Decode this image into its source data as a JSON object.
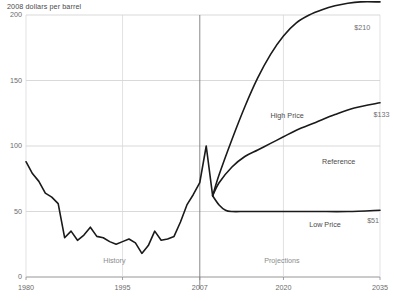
{
  "chart_data": {
    "type": "line",
    "title": "2008 dollars per barrel",
    "xlabel": "",
    "ylabel": "2008 dollars per barrel",
    "xlim": [
      1980,
      2035
    ],
    "ylim": [
      0,
      200
    ],
    "grid": true,
    "legend_position": "inline-annotations",
    "yticks": [
      "0",
      "50",
      "100",
      "150",
      "200"
    ],
    "ytick_values": [
      0,
      50,
      100,
      150,
      200
    ],
    "xticks": [
      "1980",
      "1995",
      "2007",
      "2020",
      "2035"
    ],
    "xtick_values": [
      1980,
      1995,
      2007,
      2020,
      2035
    ],
    "annotations": [
      {
        "text": "History",
        "x": 1992,
        "y": 12
      },
      {
        "text": "Projections",
        "x": 2017,
        "y": 12
      },
      {
        "text": "High Price",
        "x": 2018,
        "y": 123
      },
      {
        "text": "Reference",
        "x": 2026,
        "y": 88
      },
      {
        "text": "Low Price",
        "x": 2024,
        "y": 40
      },
      {
        "text": "$210",
        "x": 2031,
        "y": 190
      },
      {
        "text": "$133",
        "x": 2034,
        "y": 124
      },
      {
        "text": "$51",
        "x": 2033,
        "y": 43
      }
    ],
    "divider_year": 2007,
    "series": [
      {
        "name": "History",
        "color": "#1a1a1a",
        "x": [
          1980,
          1981,
          1982,
          1983,
          1984,
          1985,
          1986,
          1987,
          1988,
          1989,
          1990,
          1991,
          1992,
          1993,
          1994,
          1995,
          1996,
          1997,
          1998,
          1999,
          2000,
          2001,
          2002,
          2003,
          2004,
          2005,
          2006,
          2007,
          2008,
          2009
        ],
        "values": [
          88,
          79,
          73,
          64,
          61,
          56,
          30,
          35,
          28,
          32,
          38,
          31,
          30,
          27,
          25,
          27,
          29,
          26,
          18,
          24,
          35,
          28,
          29,
          31,
          42,
          55,
          63,
          72,
          100,
          62
        ]
      },
      {
        "name": "High Price",
        "color": "#1a1a1a",
        "x": [
          2009,
          2010,
          2012,
          2014,
          2016,
          2018,
          2020,
          2022,
          2024,
          2026,
          2028,
          2030,
          2032,
          2035
        ],
        "values": [
          62,
          78,
          105,
          130,
          152,
          170,
          184,
          194,
          200,
          204,
          207,
          209,
          210,
          210
        ]
      },
      {
        "name": "Reference",
        "color": "#1a1a1a",
        "x": [
          2009,
          2010,
          2012,
          2014,
          2016,
          2018,
          2020,
          2022,
          2025,
          2028,
          2031,
          2035
        ],
        "values": [
          62,
          72,
          84,
          92,
          97,
          102,
          107,
          112,
          118,
          124,
          129,
          133
        ]
      },
      {
        "name": "Low Price",
        "color": "#1a1a1a",
        "x": [
          2009,
          2010,
          2011,
          2012,
          2014,
          2016,
          2020,
          2025,
          2030,
          2035
        ],
        "values": [
          62,
          55,
          51,
          50,
          50,
          50,
          50,
          50,
          50,
          51
        ]
      }
    ]
  }
}
